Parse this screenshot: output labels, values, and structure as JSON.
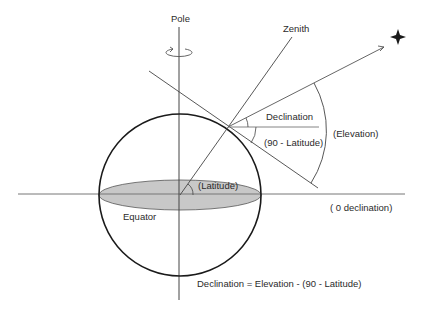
{
  "diagram": {
    "labels": {
      "pole": "Pole",
      "zenith": "Zenith",
      "declination": "Declination",
      "ninety_minus_latitude": "(90 - Latitude)",
      "elevation": "(Elevation)",
      "latitude": "(Latitude)",
      "equator": "Equator",
      "zero_declination": "( 0 declination)",
      "formula": "Declination = Elevation - (90 - Latitude)"
    },
    "icons": {
      "star": "four-point-star",
      "rotation": "rotation-arrow"
    },
    "colors": {
      "stroke": "#1a1a1a",
      "line": "#555555",
      "equator_fill": "#c8c8c8",
      "text": "#2b2b2b"
    }
  }
}
